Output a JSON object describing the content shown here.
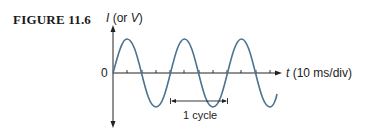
{
  "figure": {
    "label": "FIGURE 11.6",
    "y_axis_label_var": "I",
    "y_axis_label_rest": " (or ",
    "y_axis_label_var2": "V",
    "y_axis_label_close": ")",
    "origin_label": "0",
    "x_axis_label_var": "t",
    "x_axis_label_rest": " (10 ms/div)",
    "cycle_label": "1 cycle"
  },
  "colors": {
    "wave": "#4a7390",
    "axis": "#222222"
  }
}
